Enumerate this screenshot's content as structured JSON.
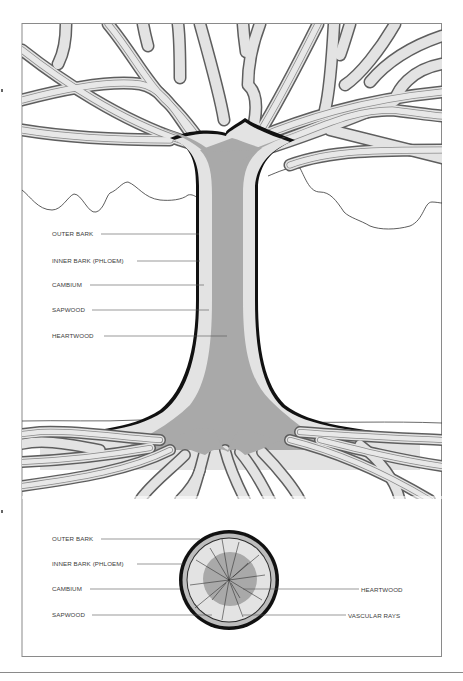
{
  "diagram": {
    "type": "tree-anatomy-illustration",
    "colors": {
      "frame": "#8a8a8a",
      "heartwood": "#a9a9a9",
      "sapwood": "#e3e3e3",
      "bark_outline": "#111111",
      "branch_edge": "#6a6a6a",
      "label_text": "#3c3c3c",
      "leader_line": "#555555",
      "background": "#ffffff"
    },
    "trunk_labels": [
      {
        "text": "OUTER BARK",
        "x": 52,
        "y": 230,
        "line_to_x": 199,
        "line_y": 234
      },
      {
        "text": "INNER BARK (PHLOEM)",
        "x": 52,
        "y": 257,
        "line_to_x": 200,
        "line_y": 261
      },
      {
        "text": "CAMBIUM",
        "x": 52,
        "y": 281,
        "line_to_x": 204,
        "line_y": 285
      },
      {
        "text": "SAPWOOD",
        "x": 52,
        "y": 306,
        "line_to_x": 209,
        "line_y": 310
      },
      {
        "text": "HEARTWOOD",
        "x": 52,
        "y": 332,
        "line_to_x": 227,
        "line_y": 336
      }
    ],
    "cross_section_labels_left": [
      {
        "text": "OUTER BARK",
        "x": 52,
        "y": 535,
        "line_to_x": 200,
        "line_y": 539
      },
      {
        "text": "INNER BARK (PHLOEM)",
        "x": 52,
        "y": 560,
        "line_to_x": 183,
        "line_y": 564
      },
      {
        "text": "CAMBIUM",
        "x": 52,
        "y": 585,
        "line_to_x": 180,
        "line_y": 589
      },
      {
        "text": "SAPWOOD",
        "x": 52,
        "y": 611,
        "line_to_x": 212,
        "line_y": 615
      }
    ],
    "cross_section_labels_right": [
      {
        "text": "HEARTWOOD",
        "x": 361,
        "y": 586,
        "line_from_x": 243,
        "line_y": 589
      },
      {
        "text": "VASCULAR RAYS",
        "x": 348,
        "y": 612,
        "line_from_x": 243,
        "line_y": 615
      }
    ]
  }
}
